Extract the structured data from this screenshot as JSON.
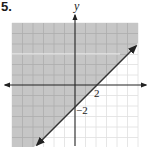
{
  "problem": {
    "number": "5."
  },
  "graph": {
    "type": "linear-inequality",
    "inequality": "y ≥ x − 2",
    "boundary_line": {
      "equation": "y = x − 2",
      "style": "solid",
      "slope": 1,
      "y_intercept": -2,
      "x_intercept": 2
    },
    "shaded_region": "above the line",
    "axes": {
      "x_label": "",
      "y_label": "y"
    },
    "tick_labels": {
      "x": "2",
      "y": "−2"
    },
    "grid": {
      "unit": 1,
      "x_range": [
        -6,
        6
      ],
      "y_range": [
        -6,
        6
      ]
    },
    "colors": {
      "shade": "#c8c8c8",
      "grid": "#b5b5b5",
      "grid_light": "#e2e2e2",
      "axis": "#222222",
      "line": "#333333"
    }
  }
}
